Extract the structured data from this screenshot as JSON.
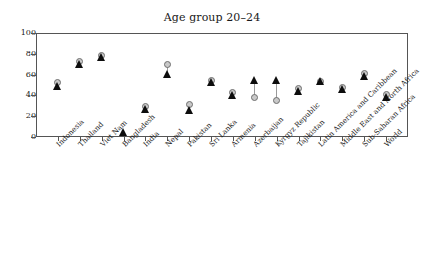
{
  "chart_data": {
    "type": "scatter",
    "title": "Age group 20–24",
    "xlabel": "",
    "ylabel": "",
    "ylim": [
      0,
      100
    ],
    "yticks": [
      0,
      20,
      40,
      60,
      80,
      100
    ],
    "grid": false,
    "legend": "none",
    "categories": [
      "Indonesia",
      "Thailand",
      "Viet Nam",
      "Bangladesh",
      "India",
      "Nepal",
      "Pakistan",
      "Sri Lanka",
      "Armenia",
      "Azerbaijan",
      "Kyrgyz Republic",
      "Tajikistan",
      "Latin America and Caribbean",
      "Middle East and North Africa",
      "Sub-Saharan Africa",
      "World"
    ],
    "series": [
      {
        "name": "circle-marker",
        "marker": "circle",
        "color": "#c9c9c9",
        "values": [
          52,
          73,
          78,
          null,
          29,
          70,
          31,
          54,
          43,
          38,
          35,
          47,
          53,
          48,
          61,
          41
        ]
      },
      {
        "name": "triangle-marker",
        "marker": "triangle",
        "color": "#0d0d0d",
        "values": [
          49,
          70,
          77,
          5,
          27,
          61,
          26,
          53,
          40,
          55,
          55,
          44,
          54,
          46,
          59,
          38
        ]
      }
    ]
  }
}
